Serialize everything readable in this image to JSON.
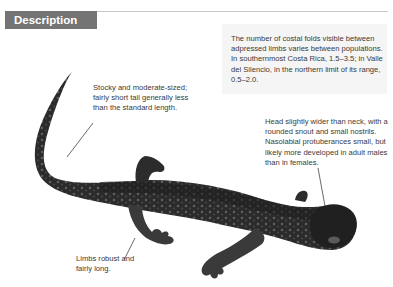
{
  "header": {
    "title": "Description"
  },
  "info_box": {
    "text": "The number of costal folds visible between adpressed limbs varies between populations. In southernmost Costa Rica, 1.5–3.5; in Valle del Silencio, in the northern limit of its range, 0.5–2.0."
  },
  "callouts": {
    "body": "Stocky and moderate-sized; fairly short tail generally less than the standard length.",
    "head": "Head slightly wider than neck, with a rounded snout and small nostrils. Nasolabial protuberances small, but likely more developed in adult males than in females.",
    "limbs": "Limbs robust and fairly long."
  },
  "image": {
    "subject": "salamander-photo",
    "colors": {
      "body": "#2a2a2a",
      "mottle": "#6a6a6a",
      "header_bar": "#747474",
      "rule": "#c8c8c8",
      "info_bg": "#f5f5f5"
    }
  }
}
